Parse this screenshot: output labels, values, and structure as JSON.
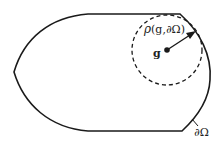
{
  "diagram": {
    "region_label": "∂Ω",
    "point_label": "g",
    "radius_label_rho": "ρ",
    "radius_label_args": "(g,∂Ω)",
    "colors": {
      "stroke": "#1a1a1a",
      "background": "#ffffff"
    },
    "shapes": {
      "domain_boundary": "closed region with curved left point, flat top and bottom edges, curved right side",
      "inscribed_circle": "dashed circle centered at g",
      "radius_arrow": "arrow from g to boundary"
    }
  }
}
